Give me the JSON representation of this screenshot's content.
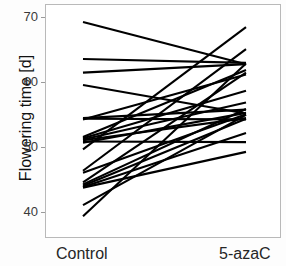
{
  "chart_data": {
    "type": "line",
    "title": "",
    "xlabel": "",
    "ylabel": "Flowering time [d]",
    "categories": [
      "Control",
      "5-azaC"
    ],
    "ylim": [
      36,
      72
    ],
    "yticks": [
      40,
      50,
      60,
      70
    ],
    "ytick_labels": [
      "40",
      "50",
      "60",
      "70"
    ],
    "grid": false,
    "legend": "none",
    "series": [
      {
        "name": "plant-1",
        "values": [
          69.4,
          62.9
        ]
      },
      {
        "name": "plant-2",
        "values": [
          63.7,
          63.1
        ]
      },
      {
        "name": "plant-3",
        "values": [
          61.6,
          62.9
        ]
      },
      {
        "name": "plant-4",
        "values": [
          59.7,
          55.3
        ]
      },
      {
        "name": "plant-5",
        "values": [
          54.6,
          55.9
        ]
      },
      {
        "name": "plant-6",
        "values": [
          54.5,
          54.4
        ]
      },
      {
        "name": "plant-7",
        "values": [
          54.4,
          61.3
        ]
      },
      {
        "name": "plant-8",
        "values": [
          51.7,
          62.0
        ]
      },
      {
        "name": "plant-9",
        "values": [
          51.5,
          58.8
        ]
      },
      {
        "name": "plant-10",
        "values": [
          51.3,
          57.0
        ]
      },
      {
        "name": "plant-11",
        "values": [
          51.2,
          54.6
        ]
      },
      {
        "name": "plant-12",
        "values": [
          51.0,
          50.9
        ]
      },
      {
        "name": "plant-13",
        "values": [
          50.8,
          55.4
        ]
      },
      {
        "name": "plant-14",
        "values": [
          49.8,
          68.6
        ]
      },
      {
        "name": "plant-15",
        "values": [
          46.5,
          65.2
        ]
      },
      {
        "name": "plant-16",
        "values": [
          46.2,
          55.2
        ]
      },
      {
        "name": "plant-17",
        "values": [
          44.7,
          61.6
        ]
      },
      {
        "name": "plant-18",
        "values": [
          44.4,
          56.0
        ]
      },
      {
        "name": "plant-19",
        "values": [
          44.2,
          54.5
        ]
      },
      {
        "name": "plant-20",
        "values": [
          44.0,
          52.3
        ]
      },
      {
        "name": "plant-21",
        "values": [
          43.9,
          49.4
        ]
      },
      {
        "name": "plant-22",
        "values": [
          41.2,
          55.1
        ]
      },
      {
        "name": "plant-23",
        "values": [
          39.5,
          63.0
        ]
      }
    ]
  },
  "axis": {
    "y_label": "Flowering time [d]",
    "x_labels": [
      "Control",
      "5-azaC"
    ]
  },
  "style": {
    "line_color": "#000000",
    "frame_color": "#b9b9b9",
    "text_color": "#222222"
  }
}
